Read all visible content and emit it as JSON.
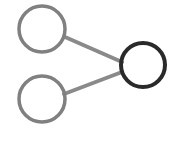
{
  "canvas": {
    "width": 178,
    "height": 143,
    "background_color": "#ffffff",
    "title": "share-network-graph"
  },
  "palette": {
    "node_default_stroke": "#808080",
    "node_highlight_stroke": "#2a2a2a",
    "edge_stroke": "#8a8a8a"
  },
  "graph": {
    "node_count": 3,
    "edge_count": 2,
    "nodes": [
      {
        "id": "node-top-left",
        "label": "",
        "cx": 42,
        "cy": 29,
        "r": 23,
        "stroke": "#808080",
        "stroke_width": 3.5,
        "state": "default"
      },
      {
        "id": "node-bottom-left",
        "label": "",
        "cx": 42,
        "cy": 99,
        "r": 23,
        "stroke": "#808080",
        "stroke_width": 3.5,
        "state": "default"
      },
      {
        "id": "node-right",
        "label": "",
        "cx": 143,
        "cy": 65,
        "r": 22,
        "stroke": "#2a2a2a",
        "stroke_width": 4,
        "state": "highlighted"
      }
    ],
    "edges": [
      {
        "id": "edge-top-left-to-right",
        "source": "node-top-left",
        "target": "node-right",
        "x1": 65,
        "y1": 37,
        "x2": 122,
        "y2": 62,
        "stroke": "#8a8a8a",
        "stroke_width": 4
      },
      {
        "id": "edge-bottom-left-to-right",
        "source": "node-bottom-left",
        "target": "node-right",
        "x1": 64,
        "y1": 94,
        "x2": 122,
        "y2": 72,
        "stroke": "#8a8a8a",
        "stroke_width": 4
      }
    ]
  }
}
